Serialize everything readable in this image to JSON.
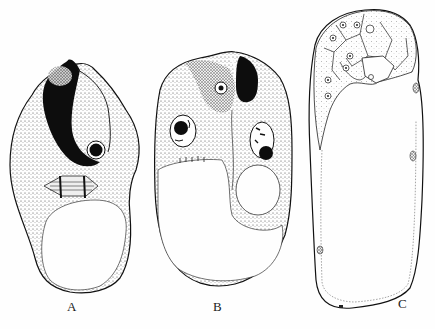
{
  "figure": {
    "type": "biological-line-drawing",
    "panels": [
      {
        "id": "A",
        "label": "A",
        "description": "cell with dark crescent mass, nucleus and spindle, large lower vacuole"
      },
      {
        "id": "B",
        "label": "B",
        "description": "cell with two nuclei, dark apical body, lower vacuoles"
      },
      {
        "id": "C",
        "label": "C",
        "description": "elongated sac with apical multicellular cap, large central cavity"
      }
    ],
    "colors": {
      "ink": "#111111",
      "stipple": "#555555",
      "paper": "#fefefe"
    }
  }
}
